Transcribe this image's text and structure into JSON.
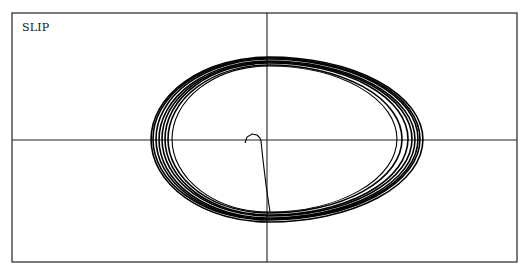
{
  "chart_data": {
    "type": "line",
    "title": "SLIP",
    "subtitle": "",
    "xlabel": "",
    "ylabel": "",
    "grid": false,
    "legend": null,
    "axes": {
      "frame": {
        "left": 12,
        "top": 13,
        "right": 517,
        "bottom": 262
      },
      "origin_px": {
        "x": 267,
        "y": 140
      },
      "tick_labels": []
    },
    "series": [
      {
        "name": "transient",
        "points": [
          [
            245,
            143
          ],
          [
            247,
            137
          ],
          [
            252,
            134
          ],
          [
            257,
            135
          ],
          [
            260,
            138
          ],
          [
            261,
            141
          ],
          [
            263,
            160
          ],
          [
            266,
            185
          ],
          [
            270,
            212
          ]
        ]
      },
      {
        "name": "limit-cycle loops",
        "loops": [
          {
            "left_x": 172,
            "right_x": 397,
            "top_y": 66,
            "bottom_y": 212
          },
          {
            "left_x": 168,
            "right_x": 402,
            "top_y": 65,
            "bottom_y": 213
          },
          {
            "left_x": 165,
            "right_x": 408,
            "top_y": 63,
            "bottom_y": 215
          },
          {
            "left_x": 162,
            "right_x": 412,
            "top_y": 62,
            "bottom_y": 216
          },
          {
            "left_x": 159,
            "right_x": 415,
            "top_y": 61,
            "bottom_y": 218
          },
          {
            "left_x": 156,
            "right_x": 418,
            "top_y": 59,
            "bottom_y": 219
          },
          {
            "left_x": 153,
            "right_x": 420,
            "top_y": 58,
            "bottom_y": 220
          },
          {
            "left_x": 151,
            "right_x": 423,
            "top_y": 57,
            "bottom_y": 222
          }
        ]
      }
    ],
    "colors": {
      "line": "#000000",
      "axis": "#222222",
      "frame": "#333333",
      "background": "#ffffff"
    }
  }
}
